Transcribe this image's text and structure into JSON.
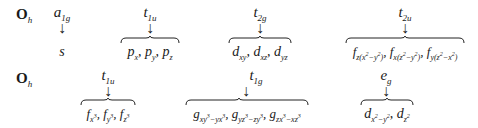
{
  "rows": [
    {
      "group": {
        "symbol": "O",
        "subscript": "h"
      },
      "items": [
        {
          "irrep": "a",
          "irrep_sub": "1g",
          "orbitals": "s",
          "brace": false
        },
        {
          "irrep": "t",
          "irrep_sub": "1u",
          "orbitals": "p_x, p_y, p_z",
          "brace": true
        },
        {
          "irrep": "t",
          "irrep_sub": "2g",
          "orbitals": "d_xy, d_xz, d_yz",
          "brace": true
        },
        {
          "irrep": "t",
          "irrep_sub": "2u",
          "orbitals": "f_z(x²−y²), f_x(z²−y²), f_y(z²−x²)",
          "brace": true
        }
      ]
    },
    {
      "group": {
        "symbol": "O",
        "subscript": "h"
      },
      "items": [
        {
          "irrep": "t",
          "irrep_sub": "1u",
          "orbitals": "f_x³, f_y³, f_z³",
          "brace": true
        },
        {
          "irrep": "t",
          "irrep_sub": "1g",
          "orbitals": "g_xy³−yx³, g_yz³−zy³, g_zx³−xz³",
          "brace": true
        },
        {
          "irrep": "e",
          "irrep_sub": "g",
          "orbitals": "d_x²−y², d_z²",
          "brace": true
        }
      ]
    }
  ],
  "labels": {
    "r0_group": "O",
    "r0_group_sub": "h",
    "r0_i0": "a",
    "r0_i0_sub": "1g",
    "r0_i0_orb": "s",
    "r0_i1": "t",
    "r0_i1_sub": "1u",
    "r0_i2": "t",
    "r0_i2_sub": "2g",
    "r0_i3": "t",
    "r0_i3_sub": "2u",
    "r1_group": "O",
    "r1_group_sub": "h",
    "r1_i0": "t",
    "r1_i0_sub": "1u",
    "r1_i1": "t",
    "r1_i1_sub": "1g",
    "r1_i2": "e",
    "r1_i2_sub": "g",
    "arrow": "↓",
    "sep": ", ",
    "p": "p",
    "d": "d",
    "f": "f",
    "g": "g",
    "x": "x",
    "y": "y",
    "z": "z",
    "xy": "xy",
    "xz": "xz",
    "yz": "yz",
    "f_z_sub": "z(x",
    "f_x_sub": "x(z",
    "f_y_sub": "y(z",
    "two": "2",
    "three": "3",
    "minus_y": "−y",
    "minus_x": "−x",
    "close": ")",
    "g1a": "xy",
    "g1b": "−yx",
    "g2a": "yz",
    "g2b": "−zy",
    "g3a": "zx",
    "g3b": "−xz",
    "dx2": "x",
    "dx2b": "−y",
    "dz": "z"
  }
}
